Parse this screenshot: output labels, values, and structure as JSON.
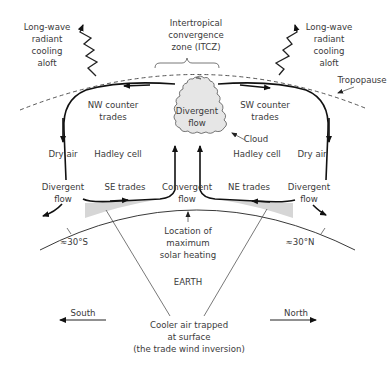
{
  "colors": {
    "background": "#ffffff",
    "text": "#3a3a3a",
    "lines": "#222222",
    "cloud_fill": "#e6e6e6",
    "shading": "#d6d6d6"
  },
  "labels": {
    "longwave_left": [
      "Long-wave",
      "radiant",
      "cooling",
      "aloft"
    ],
    "longwave_right": [
      "Long-wave",
      "radiant",
      "cooling",
      "aloft"
    ],
    "itcz": [
      "Intertropical",
      "convergence",
      "zone (ITCZ)"
    ],
    "tropopause": "Tropopause",
    "cloud_center": [
      "Divergent",
      "flow"
    ],
    "cloud": "Cloud",
    "nw_counter": [
      "NW counter",
      "trades"
    ],
    "sw_counter": [
      "SW counter",
      "trades"
    ],
    "hadley_left": "Hadley cell",
    "hadley_right": "Hadley cell",
    "dry_air_left": "Dry air",
    "dry_air_right": "Dry air",
    "divergent_left": [
      "Divergent",
      "flow"
    ],
    "divergent_right": [
      "Divergent",
      "flow"
    ],
    "se_trades": "SE trades",
    "ne_trades": "NE trades",
    "convergent": [
      "Convergent",
      "flow"
    ],
    "solar": [
      "Location of",
      "maximum",
      "solar heating"
    ],
    "lat_south": "≈30°S",
    "lat_north": "≈30°N",
    "earth": "EARTH",
    "south": "South",
    "north": "North",
    "inversion": [
      "Cooler air trapped",
      "at surface",
      "(the trade wind inversion)"
    ]
  },
  "icons": {
    "wave_arrow": "zigzag-arrow-icon",
    "cloud": "cloud-icon",
    "arrow": "arrow-icon"
  }
}
